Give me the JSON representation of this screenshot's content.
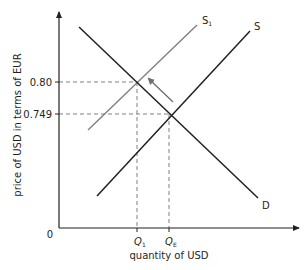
{
  "diagram": {
    "type": "supply-demand",
    "title": "",
    "y_axis_label": "price of USD in terms of EUR",
    "x_axis_label": "quantity of USD",
    "origin_label": "0",
    "y_ticks": [
      {
        "label": "0.80",
        "y": 82
      },
      {
        "label": "0.749",
        "y": 114
      }
    ],
    "x_ticks": [
      {
        "label": "Q",
        "sub": "1",
        "x": 137
      },
      {
        "label": "Q",
        "sub": "E",
        "x": 169
      }
    ],
    "curves": [
      {
        "name": "D",
        "label": "D",
        "color": "#231f20"
      },
      {
        "name": "S",
        "label": "S",
        "color": "#231f20"
      },
      {
        "name": "S1",
        "label": "S",
        "sub": "1",
        "color": "#808080"
      }
    ],
    "shift_arrow": "arrow from equilibrium toward new equilibrium (S to S1)",
    "colors": {
      "ink": "#231f20",
      "shifted": "#808080",
      "guide": "#808080"
    }
  }
}
